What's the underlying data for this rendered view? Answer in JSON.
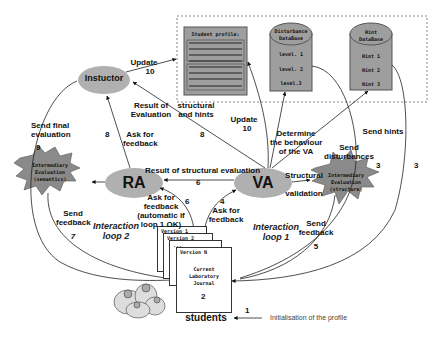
{
  "colors": {
    "node_fill": "#b0b0b0",
    "db_fill": "#9e9e9e",
    "line": "#222222",
    "dashed_border": "#888888",
    "background": "#ffffff"
  },
  "nodes": {
    "instructor": {
      "label": "Instuctor"
    },
    "ra": {
      "label": "RA"
    },
    "va": {
      "label": "VA"
    },
    "students": {
      "label": "students"
    },
    "student_profile": {
      "title": "Student profile:"
    },
    "disturbance_db": {
      "title_line1": "Disturbance",
      "title_line2": "DataBase",
      "items": [
        "level. 1",
        "level. 2",
        "level.3"
      ]
    },
    "hint_db": {
      "title_line1": "Hint",
      "title_line2": "DataBase",
      "items": [
        "Hint 1",
        "Hint 2",
        "Hint 3"
      ]
    },
    "eval_semantics": {
      "line1": "Intermediary",
      "line2": "Evaluation",
      "line3": "(semantics)"
    },
    "eval_structure": {
      "line1": "Intermediary",
      "line2": "Evaluation",
      "line3": "(structure)"
    },
    "journal": {
      "versions": [
        "Version 1",
        "Version 2",
        "...",
        "Version N"
      ],
      "line1": "Current",
      "line2": "Laboratory",
      "line3": "Journal",
      "number": "2"
    }
  },
  "labels": {
    "update_top": {
      "text": "Update",
      "num": "10"
    },
    "update_mid": {
      "text": "Update",
      "num": "10"
    },
    "result_of_evaluation": {
      "line1": "Result of",
      "line2": "Evaluation"
    },
    "structural_and_hints": {
      "line1": "structural",
      "line2": "and hints"
    },
    "num_8_mid": "8",
    "ask_for_feedback_8": {
      "line1": "Ask for",
      "line2": "feedback",
      "num": "8"
    },
    "send_final_evaluation": {
      "line1": "Send final",
      "line2": "evaluation",
      "num": "9"
    },
    "determine_behaviour": {
      "line1": "Determine",
      "line2": "the behaviour",
      "line3": "of the VA"
    },
    "send_hints": {
      "text": "Send hints",
      "num": "3"
    },
    "send_disturbances": {
      "line1": "Send",
      "line2": "disturbances",
      "num": "3"
    },
    "result_of_structural_evaluation": {
      "text": "Result of structural evaluation",
      "num": "6"
    },
    "structural_validation": {
      "line1": "Structural",
      "line2": "validation"
    },
    "ask_for_feedback_auto": {
      "line1": "Ask for",
      "line2": "feedback",
      "line3": "(automatic  if",
      "line4": "loop 1 OK)",
      "num": "6"
    },
    "ask_for_feedback_4": {
      "num": "4",
      "line1": "Ask for",
      "line2": "feedback"
    },
    "send_feedback_7": {
      "line1": "Send",
      "line2": "feedback",
      "num": "7"
    },
    "send_feedback_5": {
      "line1": "Send",
      "line2": "feedback",
      "num": "5"
    },
    "interaction_loop_2": {
      "line1": "Interaction",
      "line2": "loop 2"
    },
    "interaction_loop_1": {
      "line1": "Interaction",
      "line2": "loop 1"
    },
    "initialisation": {
      "num": "1",
      "text": "Initialisation of the profile"
    }
  }
}
